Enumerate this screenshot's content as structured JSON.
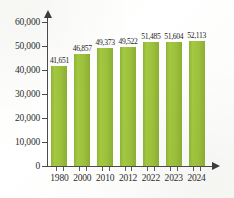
{
  "chart_data": {
    "type": "bar",
    "title": "",
    "subtitle": "",
    "xlabel": "",
    "ylabel": "",
    "categories": [
      "1980",
      "2000",
      "2010",
      "2012",
      "2022",
      "2023",
      "2024"
    ],
    "values": [
      41651,
      46857,
      49373,
      49522,
      51485,
      51604,
      52113
    ],
    "value_labels": [
      "41,651",
      "46,857",
      "49,373",
      "49,522",
      "51,485",
      "51,604",
      "52,113"
    ],
    "ylim": [
      0,
      60000
    ],
    "ytick_values": [
      0,
      10000,
      20000,
      30000,
      40000,
      50000,
      60000
    ],
    "ytick_labels": [
      "0",
      "10,000",
      "20,000",
      "30,000",
      "40,000",
      "50,000",
      "60,000"
    ],
    "grid": false,
    "legend": null,
    "legend_position": "none",
    "series": [
      {
        "name": "",
        "values": [
          41651,
          46857,
          49373,
          49522,
          51485,
          51604,
          52113
        ]
      }
    ],
    "colors": {
      "bar": "#9dc13c",
      "bar_light": "#a4c840",
      "bar_dark": "#8cae36",
      "axis": "#4a4a4a",
      "text": "#2e2e2e",
      "background": "#fdfdfb"
    }
  }
}
